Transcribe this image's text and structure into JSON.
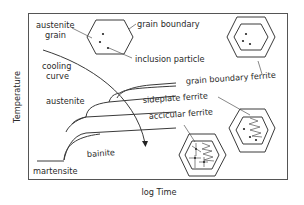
{
  "diagram": {
    "type": "CCT / TTT schematic",
    "axes": {
      "x_label": "log Time",
      "y_label": "Temperature"
    },
    "labels": {
      "austenite_grain_line1": "austenite",
      "austenite_grain_line2": "grain",
      "grain_boundary": "grain boundary",
      "inclusion_particle": "inclusion particle",
      "cooling_curve_line1": "cooling",
      "cooling_curve_line2": "curve",
      "austenite_region": "austenite",
      "grain_boundary_ferrite": "grain boundary ferrite",
      "sideplate_ferrite": "sideplate ferrite",
      "accicular_ferrite": "accicular ferrite",
      "bainite": "bainite",
      "martensite": "martensite"
    },
    "phases": [
      "grain boundary ferrite",
      "sideplate ferrite",
      "accicular ferrite",
      "bainite",
      "martensite"
    ],
    "microstructure_icons": [
      {
        "name": "austenite grain with inclusions",
        "shape": "hexagon",
        "dots": 3
      },
      {
        "name": "grain boundary ferrite",
        "shape": "double hexagon",
        "dots": 3
      },
      {
        "name": "sideplate ferrite",
        "shape": "double hexagon with zigzag plates",
        "dots": 3
      },
      {
        "name": "accicular ferrite",
        "shape": "double hexagon with zigzag plates and needles"
      }
    ],
    "colors": {
      "line": "#3a3a3a",
      "text": "#2a2a2a",
      "background": "#ffffff"
    }
  }
}
